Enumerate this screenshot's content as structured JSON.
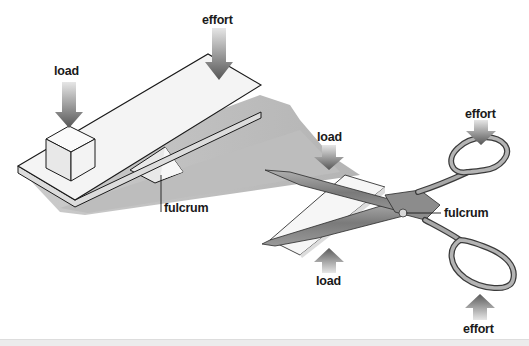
{
  "figure": {
    "type": "lever-diagram",
    "lever_1": {
      "name": "seesaw",
      "labels": {
        "load": "load",
        "effort": "effort",
        "fulcrum": "fulcrum"
      }
    },
    "lever_2": {
      "name": "scissors",
      "labels": {
        "load_top": "load",
        "load_bottom": "load",
        "effort_top": "effort",
        "effort_bottom": "effort",
        "fulcrum": "fulcrum"
      }
    },
    "colors": {
      "arrow_dark": "#5a5a5a",
      "arrow_light": "#d8d8d8",
      "plank": "#f2f2f2",
      "shadow": "#b8b8b8",
      "outline": "#1a1a1a",
      "metal": "#8a8a8a"
    }
  }
}
